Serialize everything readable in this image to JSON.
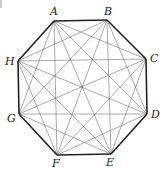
{
  "diagram": {
    "vertices": [
      {
        "label": "A",
        "x": 54,
        "y": 21,
        "lx": 50,
        "ly": 15
      },
      {
        "label": "B",
        "x": 107,
        "y": 20,
        "lx": 104,
        "ly": 15
      },
      {
        "label": "C",
        "x": 146,
        "y": 59,
        "lx": 150,
        "ly": 62
      },
      {
        "label": "D",
        "x": 147,
        "y": 114,
        "lx": 151,
        "ly": 118
      },
      {
        "label": "E",
        "x": 111,
        "y": 154,
        "lx": 106,
        "ly": 166
      },
      {
        "label": "F",
        "x": 57,
        "y": 155,
        "lx": 52,
        "ly": 167
      },
      {
        "label": "G",
        "x": 19,
        "y": 114,
        "lx": 7,
        "ly": 122
      },
      {
        "label": "H",
        "x": 18,
        "y": 61,
        "lx": 5,
        "ly": 65
      }
    ],
    "edge_color": "#222222",
    "diagonal_color": "#555555"
  }
}
